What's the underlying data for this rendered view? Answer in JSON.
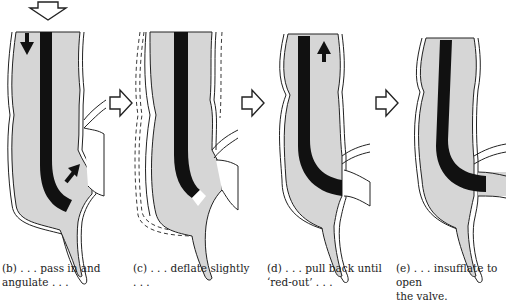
{
  "colors": {
    "lumen_fill": "#d6d6d6",
    "scope": "#111111",
    "outline": "#222222",
    "background": "#ffffff"
  },
  "panels": [
    {
      "id": "b",
      "caption": "(b) . . . pass in and\nangulate . . .",
      "arrows": [
        "down-arrow",
        "up-right-arrow"
      ]
    },
    {
      "id": "c",
      "caption": "(c) . . . deflate slightly\n. . .",
      "arrows": []
    },
    {
      "id": "d",
      "caption": "(d) . . . pull back until\n‘red-out’ . . .",
      "arrows": [
        "up-arrow"
      ]
    },
    {
      "id": "e",
      "caption": "(e) . . . insufflate to open\nthe valve.",
      "arrows": []
    }
  ],
  "step_arrows": [
    "b-to-c",
    "c-to-d",
    "d-to-e"
  ],
  "entry_arrow": "insertion-direction"
}
